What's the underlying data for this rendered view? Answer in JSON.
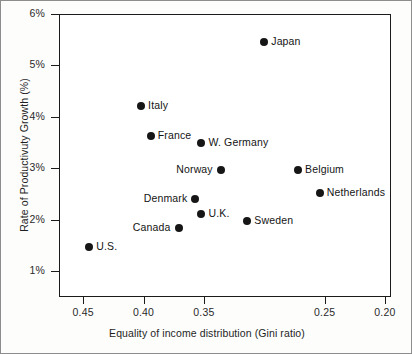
{
  "chart_data": {
    "type": "scatter",
    "title": "",
    "xlabel": "Equality of income distribution (Gini ratio)",
    "ylabel": "Rate of Productivuty Growth (%)",
    "xlim": [
      0.47,
      0.195
    ],
    "ylim": [
      0.5,
      6.0
    ],
    "x_inverted": true,
    "grid": false,
    "legend": "none",
    "xticks": [
      "0.45",
      "0.40",
      "0.35",
      "0.25",
      "0.20"
    ],
    "xtick_values": [
      0.45,
      0.4,
      0.35,
      0.25,
      0.2
    ],
    "yticks": [
      "1%",
      "2%",
      "3%",
      "4%",
      "5%",
      "6%"
    ],
    "ytick_values": [
      1,
      2,
      3,
      4,
      5,
      6
    ],
    "points": [
      {
        "label": "Japan",
        "x": 0.3,
        "y": 5.45,
        "label_side": "right"
      },
      {
        "label": "Italy",
        "x": 0.402,
        "y": 4.22,
        "label_side": "right"
      },
      {
        "label": "France",
        "x": 0.394,
        "y": 3.63,
        "label_side": "right"
      },
      {
        "label": "W. Germany",
        "x": 0.352,
        "y": 3.49,
        "label_side": "right"
      },
      {
        "label": "Norway",
        "x": 0.336,
        "y": 2.96,
        "label_side": "left"
      },
      {
        "label": "Belgium",
        "x": 0.272,
        "y": 2.96,
        "label_side": "right"
      },
      {
        "label": "Netherlands",
        "x": 0.254,
        "y": 2.52,
        "label_side": "right"
      },
      {
        "label": "Denmark",
        "x": 0.357,
        "y": 2.41,
        "label_side": "left"
      },
      {
        "label": "U.K.",
        "x": 0.352,
        "y": 2.12,
        "label_side": "right"
      },
      {
        "label": "Sweden",
        "x": 0.314,
        "y": 1.98,
        "label_side": "right"
      },
      {
        "label": "Canada",
        "x": 0.371,
        "y": 1.85,
        "label_side": "left"
      },
      {
        "label": "U.S.",
        "x": 0.445,
        "y": 1.47,
        "label_side": "right"
      }
    ]
  }
}
